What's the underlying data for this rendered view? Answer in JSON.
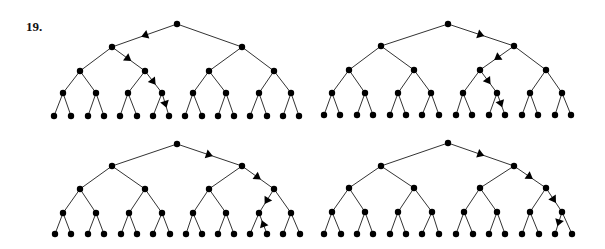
{
  "problem_label": "19.",
  "colors": {
    "edge": "#333333",
    "node": "#000000",
    "arrow": "#000000",
    "background": "#ffffff"
  },
  "layout": {
    "levels_x_offsets": "full binary tree of depth 4 (16 leaves)",
    "node_radius": 3.2
  },
  "trees": [
    {
      "name": "tree-top-left",
      "root": [
        177,
        24
      ],
      "level_y": [
        24,
        47,
        71,
        93,
        116
      ],
      "level_x": [
        [
          177
        ],
        [
          112,
          242
        ],
        [
          80,
          145,
          209,
          274
        ],
        [
          63,
          96,
          128,
          162,
          193,
          226,
          259,
          291
        ],
        [
          54,
          71,
          88,
          104,
          120,
          137,
          153,
          169,
          185,
          202,
          218,
          234,
          250,
          267,
          283,
          299
        ]
      ],
      "path_arrows": [
        {
          "from": [
            0,
            0
          ],
          "to": [
            1,
            0
          ],
          "dir": "down"
        },
        {
          "from": [
            1,
            0
          ],
          "to": [
            2,
            1
          ],
          "dir": "down"
        },
        {
          "from": [
            2,
            1
          ],
          "to": [
            3,
            3
          ],
          "dir": "down"
        },
        {
          "from": [
            3,
            3
          ],
          "to": [
            4,
            7
          ],
          "dir": "down"
        }
      ]
    },
    {
      "name": "tree-top-right",
      "level_y": [
        24,
        46,
        70,
        93,
        115
      ],
      "level_x": [
        [
          448
        ],
        [
          381,
          514
        ],
        [
          349,
          414,
          480,
          546
        ],
        [
          332,
          365,
          398,
          431,
          463,
          497,
          530,
          562
        ],
        [
          324,
          340,
          357,
          373,
          390,
          406,
          422,
          439,
          456,
          472,
          489,
          505,
          522,
          538,
          555,
          571
        ]
      ],
      "path_arrows": [
        {
          "from": [
            0,
            0
          ],
          "to": [
            1,
            1
          ],
          "dir": "down"
        },
        {
          "from": [
            1,
            1
          ],
          "to": [
            2,
            2
          ],
          "dir": "down"
        },
        {
          "from": [
            2,
            2
          ],
          "to": [
            3,
            5
          ],
          "dir": "down"
        },
        {
          "from": [
            3,
            5
          ],
          "to": [
            4,
            11
          ],
          "dir": "down"
        }
      ]
    },
    {
      "name": "tree-bottom-left",
      "level_y": [
        144,
        166,
        189,
        213,
        234
      ],
      "level_x": [
        [
          177
        ],
        [
          112,
          242
        ],
        [
          80,
          145,
          209,
          274
        ],
        [
          63,
          96,
          129,
          162,
          193,
          226,
          259,
          291
        ],
        [
          55,
          71,
          88,
          104,
          121,
          137,
          153,
          170,
          186,
          202,
          218,
          234,
          250,
          267,
          283,
          300
        ]
      ],
      "path_arrows": [
        {
          "from": [
            0,
            0
          ],
          "to": [
            1,
            1
          ],
          "dir": "down"
        },
        {
          "from": [
            1,
            1
          ],
          "to": [
            2,
            3
          ],
          "dir": "down"
        },
        {
          "from": [
            2,
            3
          ],
          "to": [
            3,
            6
          ],
          "dir": "down"
        },
        {
          "from": [
            3,
            6
          ],
          "to": [
            4,
            13
          ],
          "dir": "up"
        }
      ]
    },
    {
      "name": "tree-bottom-right",
      "level_y": [
        143,
        166,
        188,
        212,
        234
      ],
      "level_x": [
        [
          448
        ],
        [
          381,
          514
        ],
        [
          349,
          414,
          480,
          546
        ],
        [
          332,
          365,
          398,
          432,
          464,
          497,
          530,
          562
        ],
        [
          324,
          341,
          357,
          373,
          390,
          406,
          422,
          439,
          456,
          473,
          489,
          505,
          522,
          539,
          555,
          572
        ]
      ],
      "path_arrows": [
        {
          "from": [
            0,
            0
          ],
          "to": [
            1,
            1
          ],
          "dir": "down"
        },
        {
          "from": [
            1,
            1
          ],
          "to": [
            2,
            3
          ],
          "dir": "down"
        },
        {
          "from": [
            2,
            3
          ],
          "to": [
            3,
            7
          ],
          "dir": "down"
        },
        {
          "from": [
            3,
            7
          ],
          "to": [
            4,
            14
          ],
          "dir": "down"
        }
      ]
    }
  ]
}
